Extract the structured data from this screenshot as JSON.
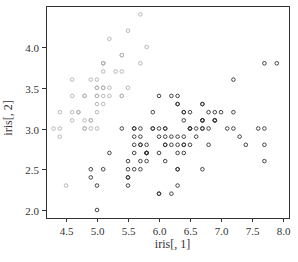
{
  "chart_data": {
    "type": "scatter",
    "title": "",
    "xlabel": "iris[, 1]",
    "ylabel": "iris[, 2]",
    "xlim": [
      4.3,
      8.0
    ],
    "ylim": [
      2.0,
      4.4
    ],
    "xticks": [
      4.5,
      5.0,
      5.5,
      6.0,
      6.5,
      7.0,
      7.5,
      8.0
    ],
    "yticks": [
      2.0,
      2.5,
      3.0,
      3.5,
      4.0
    ],
    "grid": false,
    "legend": null,
    "series": [
      {
        "name": "setosa",
        "color": "#b0b0b0",
        "points": [
          [
            5.1,
            3.5
          ],
          [
            4.9,
            3.0
          ],
          [
            4.7,
            3.2
          ],
          [
            4.6,
            3.1
          ],
          [
            5.0,
            3.6
          ],
          [
            5.4,
            3.9
          ],
          [
            4.6,
            3.4
          ],
          [
            5.0,
            3.4
          ],
          [
            4.4,
            2.9
          ],
          [
            4.9,
            3.1
          ],
          [
            5.4,
            3.7
          ],
          [
            4.8,
            3.4
          ],
          [
            4.8,
            3.0
          ],
          [
            4.3,
            3.0
          ],
          [
            5.8,
            4.0
          ],
          [
            5.7,
            4.4
          ],
          [
            5.4,
            3.9
          ],
          [
            5.1,
            3.5
          ],
          [
            5.7,
            3.8
          ],
          [
            5.1,
            3.8
          ],
          [
            5.4,
            3.4
          ],
          [
            5.1,
            3.7
          ],
          [
            4.6,
            3.6
          ],
          [
            5.1,
            3.3
          ],
          [
            4.8,
            3.4
          ],
          [
            5.0,
            3.0
          ],
          [
            5.0,
            3.4
          ],
          [
            5.2,
            3.5
          ],
          [
            5.2,
            3.4
          ],
          [
            4.7,
            3.2
          ],
          [
            4.8,
            3.1
          ],
          [
            5.4,
            3.4
          ],
          [
            5.2,
            4.1
          ],
          [
            5.5,
            4.2
          ],
          [
            4.9,
            3.1
          ],
          [
            5.0,
            3.2
          ],
          [
            5.5,
            3.5
          ],
          [
            4.9,
            3.6
          ],
          [
            4.4,
            3.0
          ],
          [
            5.1,
            3.4
          ],
          [
            5.0,
            3.5
          ],
          [
            4.5,
            2.3
          ],
          [
            4.4,
            3.2
          ],
          [
            5.0,
            3.5
          ],
          [
            5.1,
            3.8
          ],
          [
            4.8,
            3.0
          ],
          [
            5.1,
            3.8
          ],
          [
            4.6,
            3.2
          ],
          [
            5.3,
            3.7
          ],
          [
            5.0,
            3.3
          ]
        ]
      },
      {
        "name": "versicolor",
        "color": "#333333",
        "points": [
          [
            7.0,
            3.2
          ],
          [
            6.4,
            3.2
          ],
          [
            6.9,
            3.1
          ],
          [
            5.5,
            2.3
          ],
          [
            6.5,
            2.8
          ],
          [
            5.7,
            2.8
          ],
          [
            6.3,
            3.3
          ],
          [
            4.9,
            2.4
          ],
          [
            6.6,
            2.9
          ],
          [
            5.2,
            2.7
          ],
          [
            5.0,
            2.0
          ],
          [
            5.9,
            3.0
          ],
          [
            6.0,
            2.2
          ],
          [
            6.1,
            2.9
          ],
          [
            5.6,
            2.9
          ],
          [
            6.7,
            3.1
          ],
          [
            5.6,
            3.0
          ],
          [
            5.8,
            2.7
          ],
          [
            6.2,
            2.2
          ],
          [
            5.6,
            2.5
          ],
          [
            5.9,
            3.2
          ],
          [
            6.1,
            2.8
          ],
          [
            6.3,
            2.5
          ],
          [
            6.1,
            2.8
          ],
          [
            6.4,
            2.9
          ],
          [
            6.6,
            3.0
          ],
          [
            6.8,
            2.8
          ],
          [
            6.7,
            3.0
          ],
          [
            6.0,
            2.9
          ],
          [
            5.7,
            2.6
          ],
          [
            5.5,
            2.4
          ],
          [
            5.5,
            2.4
          ],
          [
            5.8,
            2.7
          ],
          [
            6.0,
            2.7
          ],
          [
            5.4,
            3.0
          ],
          [
            6.0,
            3.4
          ],
          [
            6.7,
            3.1
          ],
          [
            6.3,
            2.3
          ],
          [
            5.6,
            3.0
          ],
          [
            5.5,
            2.5
          ],
          [
            5.5,
            2.6
          ],
          [
            6.1,
            3.0
          ],
          [
            5.8,
            2.6
          ],
          [
            5.0,
            2.3
          ],
          [
            5.6,
            2.7
          ],
          [
            5.7,
            3.0
          ],
          [
            5.7,
            2.9
          ],
          [
            6.2,
            2.9
          ],
          [
            5.1,
            2.5
          ],
          [
            5.7,
            2.8
          ]
        ]
      },
      {
        "name": "virginica",
        "color": "#333333",
        "points": [
          [
            6.3,
            3.3
          ],
          [
            5.8,
            2.7
          ],
          [
            7.1,
            3.0
          ],
          [
            6.3,
            2.9
          ],
          [
            6.5,
            3.0
          ],
          [
            7.6,
            3.0
          ],
          [
            4.9,
            2.5
          ],
          [
            7.3,
            2.9
          ],
          [
            6.7,
            2.5
          ],
          [
            7.2,
            3.6
          ],
          [
            6.5,
            3.2
          ],
          [
            6.4,
            2.7
          ],
          [
            6.8,
            3.0
          ],
          [
            5.7,
            2.5
          ],
          [
            5.8,
            2.8
          ],
          [
            6.4,
            3.2
          ],
          [
            6.5,
            3.0
          ],
          [
            7.7,
            3.8
          ],
          [
            7.7,
            2.6
          ],
          [
            6.0,
            2.2
          ],
          [
            6.9,
            3.2
          ],
          [
            5.6,
            2.8
          ],
          [
            7.7,
            2.8
          ],
          [
            6.3,
            2.7
          ],
          [
            6.7,
            3.3
          ],
          [
            7.2,
            3.2
          ],
          [
            6.2,
            2.8
          ],
          [
            6.1,
            3.0
          ],
          [
            6.4,
            2.8
          ],
          [
            7.2,
            3.0
          ],
          [
            7.4,
            2.8
          ],
          [
            7.9,
            3.8
          ],
          [
            6.4,
            2.8
          ],
          [
            6.3,
            2.8
          ],
          [
            6.1,
            2.6
          ],
          [
            7.7,
            3.0
          ],
          [
            6.3,
            3.4
          ],
          [
            6.4,
            3.1
          ],
          [
            6.0,
            3.0
          ],
          [
            6.9,
            3.1
          ],
          [
            6.7,
            3.1
          ],
          [
            6.9,
            3.1
          ],
          [
            5.8,
            2.7
          ],
          [
            6.8,
            3.2
          ],
          [
            6.7,
            3.3
          ],
          [
            6.7,
            3.0
          ],
          [
            6.3,
            2.5
          ],
          [
            6.5,
            3.0
          ],
          [
            6.2,
            3.4
          ],
          [
            5.9,
            3.0
          ]
        ]
      }
    ]
  },
  "layout": {
    "plot": {
      "left": 46,
      "top": 6,
      "right": 289,
      "bottom": 218
    },
    "x_map": {
      "v0": 4.5,
      "px0": 66,
      "px_per_unit": 62
    },
    "y_map": {
      "v0": 2.0,
      "px0": 210,
      "px_per_unit": 81.5
    }
  }
}
